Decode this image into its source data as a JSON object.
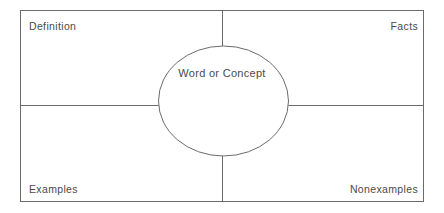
{
  "diagram": {
    "type": "frayer-model",
    "center": {
      "label": "Word or Concept",
      "shape": "ellipse"
    },
    "quadrants": [
      {
        "key": "definition",
        "label": "Definition",
        "position": "top-left"
      },
      {
        "key": "facts",
        "label": "Facts",
        "position": "top-right"
      },
      {
        "key": "examples",
        "label": "Examples",
        "position": "bottom-left"
      },
      {
        "key": "nonexamples",
        "label": "Nonexamples",
        "position": "bottom-right"
      }
    ],
    "colors": {
      "stroke": "#6b6b6b",
      "text": "#4a4a4a",
      "background": "#ffffff"
    }
  }
}
